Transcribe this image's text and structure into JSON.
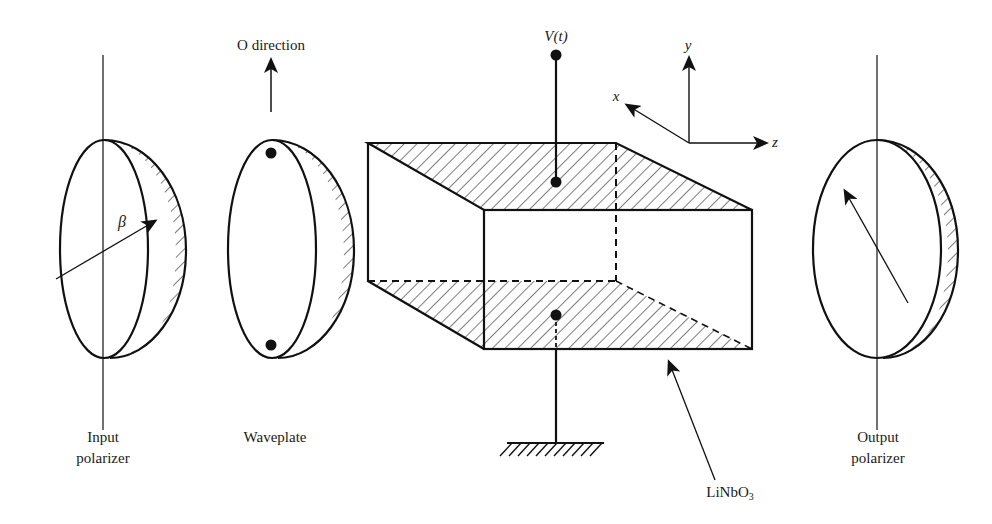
{
  "figure": {
    "colors": {
      "stroke": "#111111",
      "background": "#ffffff"
    }
  },
  "labels": {
    "o_direction": "O direction",
    "voltage": "V(t)",
    "axis_x": "x",
    "axis_y": "y",
    "axis_z": "z",
    "beta": "β",
    "input_polarizer_line1": "Input",
    "input_polarizer_line2": "polarizer",
    "waveplate": "Waveplate",
    "crystal_main": "LiNbO",
    "crystal_sub": "3",
    "output_polarizer_line1": "Output",
    "output_polarizer_line2": "polarizer"
  },
  "components": [
    {
      "name": "Input polarizer",
      "type": "polarizer",
      "transmission_axis": "tilted by angle β"
    },
    {
      "name": "Waveplate",
      "type": "waveplate",
      "marker": "O direction (vertical)"
    },
    {
      "name": "LiNbO3",
      "type": "electro-optic crystal",
      "electrodes": [
        "top: V(t)",
        "bottom: ground"
      ]
    },
    {
      "name": "Output polarizer",
      "type": "polarizer",
      "transmission_axis": "tilted"
    }
  ],
  "axes": [
    "x",
    "y",
    "z"
  ]
}
